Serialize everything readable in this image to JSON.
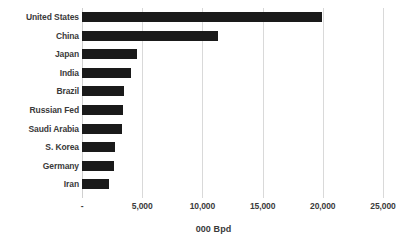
{
  "chart_data": {
    "type": "bar",
    "orientation": "horizontal",
    "title": "",
    "subtitle": "",
    "xlabel": "000 Bpd",
    "ylabel": "",
    "categories": [
      "United States",
      "China",
      "Japan",
      "India",
      "Brazil",
      "Russian Fed",
      "Saudi Arabia",
      "S. Korea",
      "Germany",
      "Iran"
    ],
    "values": [
      19900,
      11300,
      4600,
      4050,
      3500,
      3430,
      3350,
      2740,
      2680,
      2240
    ],
    "series": [
      {
        "name": "Oil consumption",
        "values": [
          19900,
          11300,
          4600,
          4050,
          3500,
          3430,
          3350,
          2740,
          2680,
          2240
        ]
      }
    ],
    "xlim": [
      0,
      25000
    ],
    "xticks": [
      0,
      5000,
      10000,
      15000,
      20000,
      25000
    ],
    "xtick_labels": [
      "-",
      "5,000",
      "10,000",
      "15,000",
      "20,000",
      "25,000"
    ],
    "grid": "vertical-major",
    "legend": null,
    "legend_position": "none",
    "bar_color": "#1a1a1a",
    "gridline_color": "#d9d9d9",
    "text_color": "#3a3a3a",
    "background_color": "#ffffff"
  }
}
